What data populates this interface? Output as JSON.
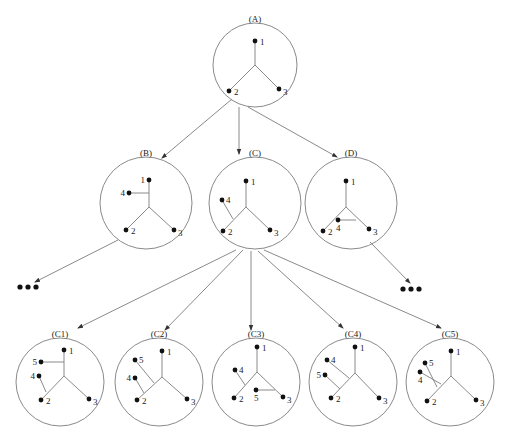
{
  "diagram": {
    "title": "",
    "colors": {
      "stroke": "#8a8a8a",
      "leaf": "#111111",
      "text": "#222222"
    },
    "ellipsis_glyph": "•••",
    "nodes": [
      {
        "id": "A",
        "label": "(A)",
        "cx": 255,
        "cy": 65,
        "r": 42,
        "leaves": [
          {
            "id": "1",
            "x": 255,
            "y": 41
          },
          {
            "id": "2",
            "x": 229,
            "y": 91
          },
          {
            "id": "3",
            "x": 279,
            "y": 89
          }
        ],
        "center": [
          255,
          65
        ],
        "attach": []
      },
      {
        "id": "B",
        "label": "(B)",
        "cx": 146,
        "cy": 203,
        "r": 46,
        "leaves": [
          {
            "id": "1",
            "x": 149,
            "y": 180
          },
          {
            "id": "2",
            "x": 126,
            "y": 230
          },
          {
            "id": "3",
            "x": 174,
            "y": 230
          },
          {
            "id": "4",
            "x": 129,
            "y": 193
          }
        ],
        "center": [
          149,
          207
        ],
        "attach": [
          {
            "leaf": "4",
            "on": "1",
            "at": [
              149,
              193
            ]
          }
        ]
      },
      {
        "id": "C",
        "label": "(C)",
        "cx": 255,
        "cy": 203,
        "r": 46,
        "leaves": [
          {
            "id": "1",
            "x": 246,
            "y": 181
          },
          {
            "id": "2",
            "x": 223,
            "y": 231
          },
          {
            "id": "3",
            "x": 270,
            "y": 230
          },
          {
            "id": "4",
            "x": 222,
            "y": 200
          }
        ],
        "center": [
          246,
          207
        ],
        "attach": [
          {
            "leaf": "4",
            "on": "2",
            "at": [
              233,
              219
            ]
          }
        ]
      },
      {
        "id": "D",
        "label": "(D)",
        "cx": 351,
        "cy": 203,
        "r": 46,
        "leaves": [
          {
            "id": "1",
            "x": 346,
            "y": 181
          },
          {
            "id": "2",
            "x": 323,
            "y": 231
          },
          {
            "id": "3",
            "x": 369,
            "y": 229
          },
          {
            "id": "4",
            "x": 338,
            "y": 220
          }
        ],
        "center": [
          346,
          207
        ],
        "attach": [
          {
            "leaf": "4",
            "on": "3",
            "at": [
              356,
              220
            ]
          }
        ]
      },
      {
        "id": "C1",
        "label": "(C1)",
        "cx": 60,
        "cy": 382,
        "r": 44,
        "leaves": [
          {
            "id": "1",
            "x": 64,
            "y": 350
          },
          {
            "id": "2",
            "x": 41,
            "y": 400
          },
          {
            "id": "3",
            "x": 89,
            "y": 399
          },
          {
            "id": "4",
            "x": 39,
            "y": 376
          },
          {
            "id": "5",
            "x": 41,
            "y": 362
          }
        ],
        "center": [
          64,
          376
        ],
        "attach": [
          {
            "leaf": "5",
            "on": "1",
            "at": [
              64,
              362
            ]
          },
          {
            "leaf": "4",
            "on": "2",
            "at": [
              46,
              392
            ]
          }
        ]
      },
      {
        "id": "C2",
        "label": "(C2)",
        "cx": 159,
        "cy": 382,
        "r": 44,
        "leaves": [
          {
            "id": "1",
            "x": 162,
            "y": 351
          },
          {
            "id": "2",
            "x": 137,
            "y": 400
          },
          {
            "id": "3",
            "x": 187,
            "y": 399
          },
          {
            "id": "4",
            "x": 135,
            "y": 378
          },
          {
            "id": "5",
            "x": 135,
            "y": 360
          }
        ],
        "center": [
          162,
          377
        ],
        "attach": [
          {
            "leaf": "5",
            "on": "2",
            "at": [
              154,
              383
            ]
          },
          {
            "leaf": "4",
            "on": "2",
            "at": [
              144,
              393
            ]
          }
        ]
      },
      {
        "id": "C3",
        "label": "(C3)",
        "cx": 256,
        "cy": 382,
        "r": 44,
        "leaves": [
          {
            "id": "1",
            "x": 257,
            "y": 347
          },
          {
            "id": "2",
            "x": 234,
            "y": 398
          },
          {
            "id": "3",
            "x": 283,
            "y": 397
          },
          {
            "id": "4",
            "x": 235,
            "y": 370
          },
          {
            "id": "5",
            "x": 256,
            "y": 390
          }
        ],
        "center": [
          257,
          372
        ],
        "attach": [
          {
            "leaf": "4",
            "on": "2",
            "at": [
              245,
              385
            ]
          },
          {
            "leaf": "5",
            "on": "3",
            "at": [
              275,
              390
            ]
          }
        ]
      },
      {
        "id": "C4",
        "label": "(C4)",
        "cx": 353,
        "cy": 382,
        "r": 44,
        "leaves": [
          {
            "id": "1",
            "x": 355,
            "y": 347
          },
          {
            "id": "2",
            "x": 331,
            "y": 398
          },
          {
            "id": "3",
            "x": 379,
            "y": 398
          },
          {
            "id": "4",
            "x": 327,
            "y": 360
          },
          {
            "id": "5",
            "x": 325,
            "y": 375
          }
        ],
        "center": [
          355,
          373
        ],
        "attach": [
          {
            "leaf": "4",
            "on": "2",
            "at": [
              349,
              378
            ]
          },
          {
            "leaf": "5",
            "on": "2",
            "at": [
              340,
              389
            ]
          }
        ]
      },
      {
        "id": "C5",
        "label": "(C5)",
        "cx": 450,
        "cy": 382,
        "r": 44,
        "leaves": [
          {
            "id": "1",
            "x": 451,
            "y": 351
          },
          {
            "id": "2",
            "x": 427,
            "y": 401
          },
          {
            "id": "3",
            "x": 476,
            "y": 400
          },
          {
            "id": "4",
            "x": 420,
            "y": 372
          },
          {
            "id": "5",
            "x": 425,
            "y": 363
          }
        ],
        "center": [
          451,
          376
        ],
        "attach": [
          {
            "leaf": "4",
            "on": "2",
            "at": [
              441,
              384
            ]
          },
          {
            "leaf": "5",
            "on": "2",
            "at": [
              437,
              387
            ]
          }
        ]
      }
    ],
    "edges": [
      {
        "from": "A",
        "to": "B",
        "x1": 232,
        "y1": 99,
        "x2": 162,
        "y2": 158
      },
      {
        "from": "A",
        "to": "C",
        "x1": 239,
        "y1": 107,
        "x2": 239,
        "y2": 154
      },
      {
        "from": "A",
        "to": "D",
        "x1": 248,
        "y1": 107,
        "x2": 337,
        "y2": 157
      },
      {
        "from": "B",
        "to": "more-left",
        "x1": 118,
        "y1": 240,
        "x2": 35,
        "y2": 282
      },
      {
        "from": "D",
        "to": "more-right",
        "x1": 370,
        "y1": 242,
        "x2": 410,
        "y2": 283
      },
      {
        "from": "C",
        "to": "C1",
        "x1": 236,
        "y1": 250,
        "x2": 78,
        "y2": 328
      },
      {
        "from": "C",
        "to": "C2",
        "x1": 243,
        "y1": 250,
        "x2": 165,
        "y2": 330
      },
      {
        "from": "C",
        "to": "C3",
        "x1": 251,
        "y1": 251,
        "x2": 251,
        "y2": 330
      },
      {
        "from": "C",
        "to": "C4",
        "x1": 258,
        "y1": 251,
        "x2": 343,
        "y2": 328
      },
      {
        "from": "C",
        "to": "C5",
        "x1": 264,
        "y1": 250,
        "x2": 441,
        "y2": 328
      }
    ],
    "ellipses": [
      {
        "name": "more-children-left",
        "x": 29,
        "y": 287
      },
      {
        "name": "more-children-right",
        "x": 412,
        "y": 289
      }
    ]
  }
}
